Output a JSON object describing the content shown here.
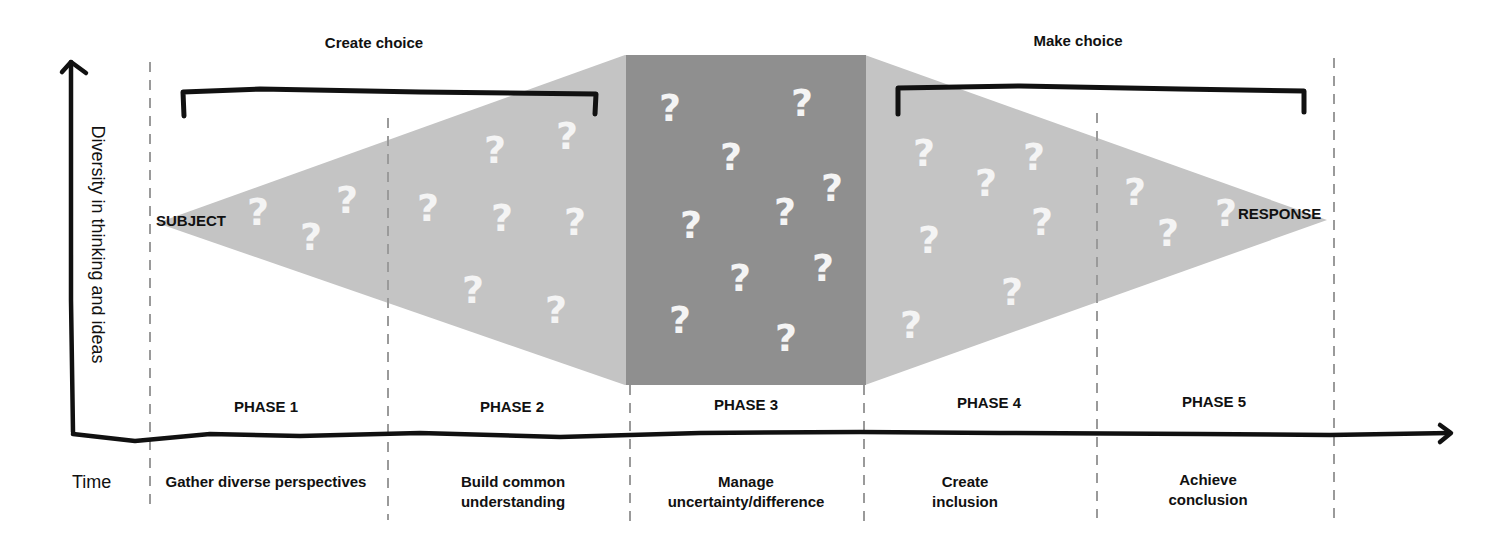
{
  "colors": {
    "light_gray": "#c4c4c4",
    "dark_gray": "#8f8f8f",
    "line": "#111111",
    "dashed": "#999999",
    "question_mark": "#f4f4f4"
  },
  "groups": {
    "create_choice": "Create choice",
    "make_choice": "Make choice"
  },
  "axis": {
    "y_label": "Diversity in thinking and ideas",
    "x_label": "Time"
  },
  "endpoints": {
    "start": "SUBJECT",
    "end": "RESPONSE"
  },
  "phases": [
    {
      "label": "PHASE 1",
      "description": "Gather diverse perspectives"
    },
    {
      "label": "PHASE 2",
      "description": "Build common understanding"
    },
    {
      "label": "PHASE 3",
      "description": "Manage uncertainty/difference"
    },
    {
      "label": "PHASE 4",
      "description": "Create inclusion"
    },
    {
      "label": "PHASE 5",
      "description": "Achieve conclusion"
    }
  ],
  "question_mark_glyph": "?"
}
